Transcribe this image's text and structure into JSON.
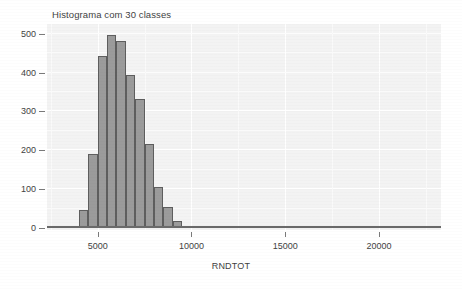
{
  "chart_data": {
    "type": "bar",
    "title": "Histograma com 30 classes",
    "xlabel": "RNDTOT",
    "ylabel": "count",
    "grid": true,
    "legend": false,
    "legend_position": "none",
    "bin_width": 500,
    "xlim": [
      2300,
      23300
    ],
    "ylim": [
      0,
      520
    ],
    "xticks": [
      5000,
      10000,
      15000,
      20000
    ],
    "xtick_labels": [
      "5000",
      "10000",
      "15000",
      "20000"
    ],
    "yticks": [
      0,
      100,
      200,
      300,
      400,
      500
    ],
    "ytick_labels": [
      "0",
      "100",
      "200",
      "300",
      "400",
      "500"
    ],
    "bin_starts": [
      2500,
      3000,
      3500,
      4000,
      4500,
      5000,
      5500,
      6000,
      6500,
      7000,
      7500,
      8000,
      8500,
      9000,
      9500,
      10000,
      10500,
      11000,
      11500,
      12000,
      12500,
      13000,
      14000,
      15000,
      16000,
      17000,
      18000,
      19000,
      20000,
      21000
    ],
    "categories": [
      "2500",
      "3000",
      "3500",
      "4000",
      "4500",
      "5000",
      "5500",
      "6000",
      "6500",
      "7000",
      "7500",
      "8000",
      "8500",
      "9000",
      "9500",
      "10000",
      "10500",
      "11000",
      "11500",
      "12000",
      "12500",
      "13000",
      "14000",
      "15000",
      "16000",
      "17000",
      "18000",
      "19000",
      "20000",
      "21000"
    ],
    "values": [
      0,
      0,
      3,
      46,
      190,
      443,
      497,
      482,
      395,
      333,
      216,
      106,
      55,
      18,
      4,
      1,
      0,
      0,
      0,
      0,
      0,
      0,
      0,
      0,
      0,
      0,
      0,
      0,
      0,
      0
    ],
    "bar_color": "#9b9b9b",
    "bar_border_color": "#5e5e5e",
    "panel_color": "#f3f3f3",
    "grid_color": "#ffffff",
    "text_color": "#3f3f3f"
  }
}
